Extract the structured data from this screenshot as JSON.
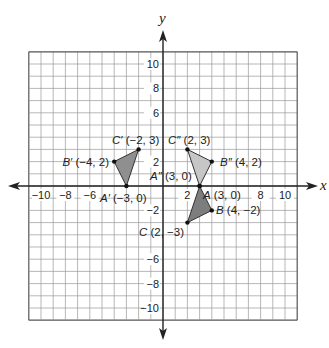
{
  "diagram": {
    "type": "coordinate-plane",
    "axes": {
      "x_label": "x",
      "y_label": "y",
      "range": [
        -11,
        11
      ],
      "grid_step": 1
    },
    "x_tick_labels": [
      {
        "value": -10,
        "text": "−10"
      },
      {
        "value": -8,
        "text": "−8"
      },
      {
        "value": -6,
        "text": "−6"
      },
      {
        "value": 2,
        "text": "2"
      },
      {
        "value": 8,
        "text": "8"
      },
      {
        "value": 10,
        "text": "10"
      }
    ],
    "y_tick_labels": [
      {
        "value": 10,
        "text": "10"
      },
      {
        "value": 8,
        "text": "8"
      },
      {
        "value": 6,
        "text": "6"
      },
      {
        "value": 2,
        "text": "2"
      },
      {
        "value": -2,
        "text": "−2"
      },
      {
        "value": -6,
        "text": "−6"
      },
      {
        "value": -8,
        "text": "−8"
      },
      {
        "value": -10,
        "text": "−10"
      }
    ],
    "triangles": [
      {
        "name": "ABC",
        "fill": "#7d7d7d",
        "vertices": [
          {
            "letter": "A",
            "x": 3,
            "y": 0,
            "label": "A (3, 0)"
          },
          {
            "letter": "B",
            "x": 4,
            "y": -2,
            "label": "B (4, −2)"
          },
          {
            "letter": "C",
            "x": 2,
            "y": -3,
            "label": "C (2, −3)"
          }
        ]
      },
      {
        "name": "A'B'C'",
        "fill": "#8f8f8f",
        "vertices": [
          {
            "letter": "A′",
            "x": -3,
            "y": 0,
            "label": "A′ (−3, 0)"
          },
          {
            "letter": "B′",
            "x": -4,
            "y": 2,
            "label": "B′ (−4, 2)"
          },
          {
            "letter": "C′",
            "x": -2,
            "y": 3,
            "label": "C′ (−2, 3)"
          }
        ]
      },
      {
        "name": "A''B''C''",
        "fill": "#c6c6c6",
        "vertices": [
          {
            "letter": "A″",
            "x": 3,
            "y": 0,
            "label": "A″ (3, 0)"
          },
          {
            "letter": "B″",
            "x": 4,
            "y": 2,
            "label": "B″ (4, 2)"
          },
          {
            "letter": "C″",
            "x": 2,
            "y": 3,
            "label": "C″ (2, 3)"
          }
        ]
      }
    ],
    "colors": {
      "grid": "#9a9a9a",
      "axis": "#222222",
      "vertex": "#111111"
    }
  }
}
